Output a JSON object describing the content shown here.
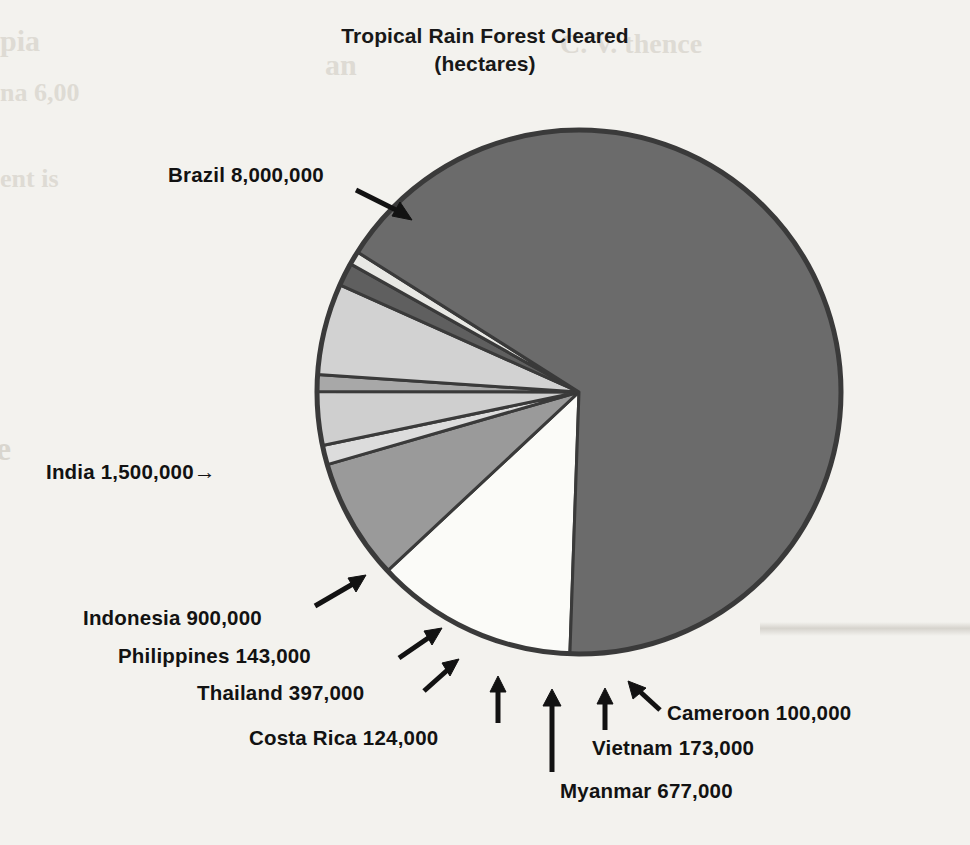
{
  "title": {
    "main": "Tropical Rain Forest Cleared",
    "sub": "(hectares)"
  },
  "labels": {
    "brazil": "Brazil 8,000,000",
    "india": "India 1,500,000",
    "india_arrow": "→",
    "indonesia": "Indonesia 900,000",
    "philippines": "Philippines 143,000",
    "thailand": "Thailand 397,000",
    "costa_rica": "Costa Rica 124,000",
    "cameroon": "Cameroon 100,000",
    "vietnam": "Vietnam 173,000",
    "myanmar": "Myanmar 677,000"
  },
  "ghost_text": {
    "l1": "pia",
    "l2": "na 6,00",
    "l3": "ent is",
    "r1": "an",
    "r2": "C. V. thence",
    "side": "e",
    "dot": "◎"
  },
  "colors": {
    "page_background": "#f3f2ee",
    "outline": "#3a3a3a",
    "text": "#121212",
    "dark_gray": "#6b6b6b",
    "medium_gray": "#9a9a9a",
    "light_gray": "#c9c9c9",
    "pale_gray": "#dcdcdc",
    "white": "#fbfbf8",
    "very_dark_gray": "#585858"
  },
  "chart_data": {
    "type": "pie",
    "title": "Tropical Rain Forest Cleared (hectares)",
    "unit": "hectares",
    "total": 12014000,
    "grid": false,
    "legend": "none (direct labels with leader arrows)",
    "start_angle_deg": 182,
    "direction": "clockwise",
    "center": {
      "x": 579,
      "y": 392
    },
    "radius": 262,
    "categories": [
      "India",
      "Indonesia",
      "Philippines",
      "Thailand",
      "Costa Rica",
      "Myanmar",
      "Vietnam",
      "Cameroon",
      "Brazil"
    ],
    "values": [
      1500000,
      900000,
      143000,
      397000,
      124000,
      677000,
      173000,
      100000,
      8000000
    ],
    "slices": [
      {
        "name": "India",
        "value": 1500000,
        "label": "India 1,500,000",
        "fill": "#fbfbf8",
        "sweep_deg": 44.95,
        "percent": 12.5
      },
      {
        "name": "Indonesia",
        "value": 900000,
        "label": "Indonesia 900,000",
        "fill": "#9a9a9a",
        "sweep_deg": 26.97,
        "percent": 7.5
      },
      {
        "name": "Philippines",
        "value": 143000,
        "label": "Philippines 143,000",
        "fill": "#dcdcdc",
        "sweep_deg": 4.29,
        "percent": 1.2
      },
      {
        "name": "Thailand",
        "value": 397000,
        "label": "Thailand 397,000",
        "fill": "#cfcfcf",
        "sweep_deg": 11.9,
        "percent": 3.3
      },
      {
        "name": "Costa Rica",
        "value": 124000,
        "label": "Costa Rica 124,000",
        "fill": "#a8a8a8",
        "sweep_deg": 3.72,
        "percent": 1.0
      },
      {
        "name": "Myanmar",
        "value": 677000,
        "label": "Myanmar 677,000",
        "fill": "#d2d2d2",
        "sweep_deg": 20.28,
        "percent": 5.6
      },
      {
        "name": "Vietnam",
        "value": 173000,
        "label": "Vietnam 173,000",
        "fill": "#5f5f5f",
        "sweep_deg": 5.18,
        "percent": 1.4
      },
      {
        "name": "Cameroon",
        "value": 100000,
        "label": "Cameroon 100,000",
        "fill": "#e8e8e4",
        "sweep_deg": 3.0,
        "percent": 0.8
      },
      {
        "name": "Brazil",
        "value": 8000000,
        "label": "Brazil 8,000,000",
        "fill": "#6b6b6b",
        "sweep_deg": 239.7,
        "percent": 66.6
      }
    ]
  }
}
